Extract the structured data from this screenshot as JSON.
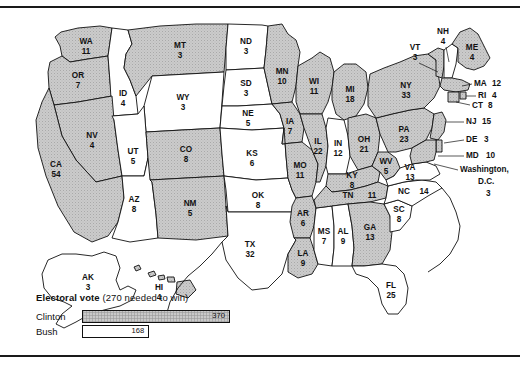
{
  "map": {
    "title": "1992 Presidential Election Electoral Vote Map",
    "shaded_fill": "#c9c9c9",
    "unshaded_fill": "#ffffff",
    "outline": "#111111"
  },
  "legend": {
    "title_bold": "Electoral vote",
    "title_note": "(270 needed to win)",
    "rows": [
      {
        "name": "Clinton",
        "value": "370",
        "numeric": 370,
        "shaded": true
      },
      {
        "name": "Bush",
        "value": "168",
        "numeric": 168,
        "shaded": false
      }
    ]
  },
  "states": [
    {
      "abbr": "WA",
      "votes": "11",
      "winner": "Clinton",
      "shaded": true
    },
    {
      "abbr": "OR",
      "votes": "7",
      "winner": "Clinton",
      "shaded": true
    },
    {
      "abbr": "CA",
      "votes": "54",
      "winner": "Clinton",
      "shaded": true
    },
    {
      "abbr": "NV",
      "votes": "4",
      "winner": "Clinton",
      "shaded": true
    },
    {
      "abbr": "ID",
      "votes": "4",
      "winner": "Bush",
      "shaded": false
    },
    {
      "abbr": "MT",
      "votes": "3",
      "winner": "Clinton",
      "shaded": true
    },
    {
      "abbr": "WY",
      "votes": "3",
      "winner": "Bush",
      "shaded": false
    },
    {
      "abbr": "UT",
      "votes": "5",
      "winner": "Bush",
      "shaded": false
    },
    {
      "abbr": "AZ",
      "votes": "8",
      "winner": "Bush",
      "shaded": false
    },
    {
      "abbr": "CO",
      "votes": "8",
      "winner": "Clinton",
      "shaded": true
    },
    {
      "abbr": "NM",
      "votes": "5",
      "winner": "Clinton",
      "shaded": true
    },
    {
      "abbr": "ND",
      "votes": "3",
      "winner": "Bush",
      "shaded": false
    },
    {
      "abbr": "SD",
      "votes": "3",
      "winner": "Bush",
      "shaded": false
    },
    {
      "abbr": "NE",
      "votes": "5",
      "winner": "Bush",
      "shaded": false
    },
    {
      "abbr": "KS",
      "votes": "6",
      "winner": "Bush",
      "shaded": false
    },
    {
      "abbr": "OK",
      "votes": "8",
      "winner": "Bush",
      "shaded": false
    },
    {
      "abbr": "TX",
      "votes": "32",
      "winner": "Bush",
      "shaded": false
    },
    {
      "abbr": "MN",
      "votes": "10",
      "winner": "Clinton",
      "shaded": true
    },
    {
      "abbr": "IA",
      "votes": "7",
      "winner": "Clinton",
      "shaded": true
    },
    {
      "abbr": "MO",
      "votes": "11",
      "winner": "Clinton",
      "shaded": true
    },
    {
      "abbr": "AR",
      "votes": "6",
      "winner": "Clinton",
      "shaded": true
    },
    {
      "abbr": "LA",
      "votes": "9",
      "winner": "Clinton",
      "shaded": true
    },
    {
      "abbr": "WI",
      "votes": "11",
      "winner": "Clinton",
      "shaded": true
    },
    {
      "abbr": "IL",
      "votes": "22",
      "winner": "Clinton",
      "shaded": true
    },
    {
      "abbr": "MS",
      "votes": "7",
      "winner": "Bush",
      "shaded": false
    },
    {
      "abbr": "MI",
      "votes": "18",
      "winner": "Clinton",
      "shaded": true
    },
    {
      "abbr": "IN",
      "votes": "12",
      "winner": "Bush",
      "shaded": false
    },
    {
      "abbr": "OH",
      "votes": "21",
      "winner": "Clinton",
      "shaded": true
    },
    {
      "abbr": "KY",
      "votes": "8",
      "winner": "Clinton",
      "shaded": true
    },
    {
      "abbr": "TN",
      "votes": "11",
      "winner": "Clinton",
      "shaded": true
    },
    {
      "abbr": "AL",
      "votes": "9",
      "winner": "Bush",
      "shaded": false
    },
    {
      "abbr": "GA",
      "votes": "13",
      "winner": "Clinton",
      "shaded": true
    },
    {
      "abbr": "FL",
      "votes": "25",
      "winner": "Bush",
      "shaded": false
    },
    {
      "abbr": "SC",
      "votes": "8",
      "winner": "Bush",
      "shaded": false
    },
    {
      "abbr": "NC",
      "votes": "14",
      "winner": "Bush",
      "shaded": false
    },
    {
      "abbr": "VA",
      "votes": "13",
      "winner": "Bush",
      "shaded": false
    },
    {
      "abbr": "WV",
      "votes": "5",
      "winner": "Clinton",
      "shaded": true
    },
    {
      "abbr": "PA",
      "votes": "23",
      "winner": "Clinton",
      "shaded": true
    },
    {
      "abbr": "NY",
      "votes": "33",
      "winner": "Clinton",
      "shaded": true
    },
    {
      "abbr": "VT",
      "votes": "3",
      "winner": "Clinton",
      "shaded": true
    },
    {
      "abbr": "NH",
      "votes": "4",
      "winner": "Bush",
      "shaded": false
    },
    {
      "abbr": "ME",
      "votes": "4",
      "winner": "Clinton",
      "shaded": true
    },
    {
      "abbr": "MA",
      "votes": "12",
      "winner": "Clinton",
      "shaded": true
    },
    {
      "abbr": "RI",
      "votes": "4",
      "winner": "Clinton",
      "shaded": true
    },
    {
      "abbr": "CT",
      "votes": "8",
      "winner": "Clinton",
      "shaded": true
    },
    {
      "abbr": "NJ",
      "votes": "15",
      "winner": "Clinton",
      "shaded": true
    },
    {
      "abbr": "DE",
      "votes": "3",
      "winner": "Clinton",
      "shaded": true
    },
    {
      "abbr": "MD",
      "votes": "10",
      "winner": "Clinton",
      "shaded": true
    },
    {
      "abbr": "AK",
      "votes": "3",
      "winner": "Bush",
      "shaded": false
    },
    {
      "abbr": "HI",
      "votes": "4",
      "winner": "Clinton",
      "shaded": true
    }
  ],
  "dc": {
    "label_line1": "Washington,",
    "label_line2": "D.C.",
    "votes": "3",
    "shaded": true
  },
  "labels": {
    "WA": "WA",
    "OR": "OR",
    "CA": "CA",
    "NV": "NV",
    "ID": "ID",
    "MT": "MT",
    "WY": "WY",
    "UT": "UT",
    "AZ": "AZ",
    "CO": "CO",
    "NM": "NM",
    "ND": "ND",
    "SD": "SD",
    "NE": "NE",
    "KS": "KS",
    "OK": "OK",
    "TX": "TX",
    "MN": "MN",
    "IA": "IA",
    "MO": "MO",
    "AR": "AR",
    "LA": "LA",
    "WI": "WI",
    "IL": "IL",
    "MS": "MS",
    "MI": "MI",
    "IN": "IN",
    "OH": "OH",
    "KY": "KY",
    "TN": "TN",
    "AL": "AL",
    "GA": "GA",
    "FL": "FL",
    "SC": "SC",
    "NC": "NC",
    "VA": "VA",
    "WV": "WV",
    "PA": "PA",
    "NY": "NY",
    "VT": "VT",
    "NH": "NH",
    "ME": "ME",
    "MA": "MA",
    "RI": "RI",
    "CT": "CT",
    "NJ": "NJ",
    "DE": "DE",
    "MD": "MD",
    "AK": "AK",
    "HI": "HI"
  }
}
